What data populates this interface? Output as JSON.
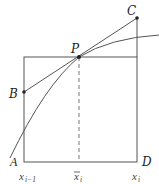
{
  "diagram": {
    "type": "geometric-construction",
    "points": {
      "A": {
        "label": "A",
        "x": 24,
        "y": 162
      },
      "D": {
        "label": "D",
        "x": 137,
        "y": 162
      },
      "P": {
        "label": "P",
        "x": 79,
        "y": 57
      },
      "B": {
        "label": "B",
        "x": 24,
        "y": 92
      },
      "C": {
        "label": "C",
        "x": 137,
        "y": 18
      }
    },
    "axis_labels": {
      "left": {
        "base": "x",
        "sub": "i−1"
      },
      "mid": {
        "base": "x̅",
        "sub": "i"
      },
      "right": {
        "base": "x",
        "sub": "i"
      }
    },
    "colors": {
      "stroke": "#555555",
      "point": "#222222",
      "dashed": "#777777"
    }
  }
}
